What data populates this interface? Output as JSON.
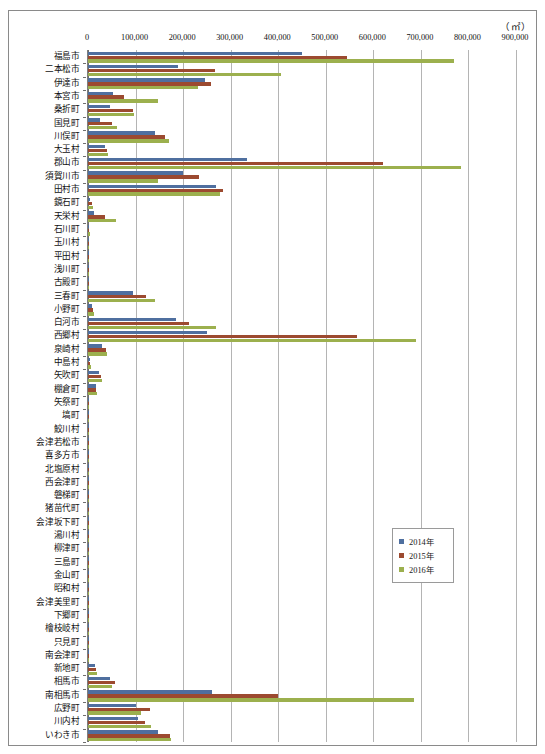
{
  "unit_label": "（㎡）",
  "legend": {
    "position": "inside-right-lower",
    "items": [
      {
        "label": "2014年",
        "color": "#4f6f9f"
      },
      {
        "label": "2015年",
        "color": "#9c4a30"
      },
      {
        "label": "2016年",
        "color": "#9cb04e"
      }
    ]
  },
  "chart_data": {
    "type": "bar",
    "orientation": "horizontal",
    "title": "",
    "subtitle": "",
    "xlabel": "（㎡）",
    "ylabel": "",
    "xlim": [
      0,
      900000
    ],
    "xticks": [
      0,
      100000,
      200000,
      300000,
      400000,
      500000,
      600000,
      700000,
      800000,
      900000
    ],
    "xtick_labels": [
      "0",
      "100,000",
      "200,000",
      "300,000",
      "400,000",
      "500,000",
      "600,000",
      "700,000",
      "800,000",
      "900,000"
    ],
    "grid": true,
    "grid_axis": "x",
    "legend_entries": [
      "2014年",
      "2015年",
      "2016年"
    ],
    "colors": [
      "#4f6f9f",
      "#9c4a30",
      "#9cb04e"
    ],
    "categories": [
      "福島市",
      "二本松市",
      "伊達市",
      "本宮市",
      "桑折町",
      "国見町",
      "川俣町",
      "大玉村",
      "郡山市",
      "須賀川市",
      "田村市",
      "鏡石町",
      "天栄村",
      "石川町",
      "玉川村",
      "平田村",
      "浅川町",
      "古殿町",
      "三春町",
      "小野町",
      "白河市",
      "西郷村",
      "泉崎村",
      "中島村",
      "矢吹町",
      "棚倉町",
      "矢祭町",
      "塙町",
      "鮫川村",
      "会津若松市",
      "喜多方市",
      "北塩原村",
      "西会津町",
      "磐梯町",
      "猪苗代町",
      "会津坂下町",
      "湯川村",
      "柳津町",
      "三島町",
      "金山町",
      "昭和村",
      "会津美里町",
      "下郷町",
      "檜枝岐村",
      "只見町",
      "南会津町",
      "新地町",
      "相馬市",
      "南相馬市",
      "広野町",
      "川内村",
      "いわき市"
    ],
    "series": [
      {
        "name": "2014年",
        "color": "#4f6f9f",
        "values": [
          450000,
          190000,
          245000,
          52000,
          47000,
          25000,
          140000,
          36000,
          335000,
          200000,
          270000,
          5000,
          12000,
          2000,
          1000,
          1000,
          700,
          600,
          95000,
          8000,
          185000,
          250000,
          30000,
          4000,
          24000,
          16000,
          1200,
          900,
          700,
          900,
          800,
          300,
          300,
          300,
          500,
          400,
          200,
          200,
          200,
          200,
          200,
          400,
          300,
          100,
          200,
          300,
          14000,
          46000,
          260000,
          100000,
          105000,
          148000
        ]
      },
      {
        "name": "2015年",
        "color": "#9c4a30",
        "values": [
          545000,
          268000,
          258000,
          76000,
          95000,
          50000,
          162000,
          41000,
          620000,
          233000,
          283000,
          9000,
          36000,
          3000,
          1500,
          1200,
          900,
          800,
          122000,
          11000,
          212000,
          565000,
          38000,
          5000,
          28000,
          17000,
          1300,
          1000,
          800,
          1200,
          1000,
          400,
          400,
          400,
          700,
          500,
          300,
          300,
          300,
          300,
          300,
          500,
          400,
          200,
          300,
          400,
          16000,
          56000,
          400000,
          130000,
          120000,
          172000
        ]
      },
      {
        "name": "2016年",
        "color": "#9cb04e",
        "values": [
          770000,
          405000,
          232000,
          148000,
          97000,
          62000,
          170000,
          42000,
          785000,
          148000,
          278000,
          10000,
          58000,
          3500,
          1800,
          1400,
          1000,
          900,
          140000,
          12000,
          270000,
          690000,
          39000,
          5500,
          30000,
          18000,
          1400,
          1100,
          900,
          1400,
          1100,
          500,
          500,
          500,
          800,
          600,
          400,
          400,
          400,
          400,
          400,
          600,
          500,
          200,
          400,
          500,
          18000,
          50000,
          685000,
          112000,
          132000,
          175000
        ]
      }
    ]
  }
}
